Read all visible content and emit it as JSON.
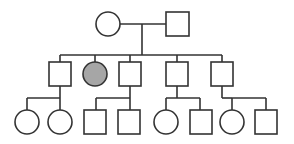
{
  "diagram": {
    "type": "pedigree",
    "colors": {
      "line": "#333333",
      "unaffected": "#ffffff",
      "affected": "#a6a6a6"
    },
    "generations": [
      {
        "level": 1,
        "individuals": [
          {
            "id": "g1-female",
            "sex": "female",
            "affected": false,
            "cx": 108,
            "cy": 24
          },
          {
            "id": "g1-male",
            "sex": "male",
            "affected": false,
            "cx": 177,
            "cy": 24
          }
        ]
      },
      {
        "level": 2,
        "individuals": [
          {
            "id": "g2-1",
            "sex": "male",
            "affected": false,
            "cx": 60,
            "cy": 74
          },
          {
            "id": "g2-2",
            "sex": "female",
            "affected": true,
            "cx": 95,
            "cy": 74
          },
          {
            "id": "g2-3",
            "sex": "male",
            "affected": false,
            "cx": 130,
            "cy": 74
          },
          {
            "id": "g2-4",
            "sex": "male",
            "affected": false,
            "cx": 177,
            "cy": 74
          },
          {
            "id": "g2-5",
            "sex": "male",
            "affected": false,
            "cx": 222,
            "cy": 74
          }
        ]
      },
      {
        "level": 3,
        "individuals": [
          {
            "id": "g3-1",
            "sex": "female",
            "affected": false,
            "parent": "g2-1",
            "cx": 27,
            "cy": 122
          },
          {
            "id": "g3-2",
            "sex": "female",
            "affected": false,
            "parent": "g2-1",
            "cx": 60,
            "cy": 122
          },
          {
            "id": "g3-3",
            "sex": "male",
            "affected": false,
            "parent": "g2-3",
            "cx": 96,
            "cy": 122
          },
          {
            "id": "g3-4",
            "sex": "male",
            "affected": false,
            "parent": "g2-3",
            "cx": 130,
            "cy": 122
          },
          {
            "id": "g3-5",
            "sex": "female",
            "affected": false,
            "parent": "g2-4",
            "cx": 166,
            "cy": 122
          },
          {
            "id": "g3-6",
            "sex": "male",
            "affected": false,
            "parent": "g2-4",
            "cx": 201,
            "cy": 122
          },
          {
            "id": "g3-7",
            "sex": "female",
            "affected": false,
            "parent": "g2-5",
            "cx": 232,
            "cy": 122
          },
          {
            "id": "g3-8",
            "sex": "male",
            "affected": false,
            "parent": "g2-5",
            "cx": 266,
            "cy": 122
          }
        ]
      }
    ]
  }
}
